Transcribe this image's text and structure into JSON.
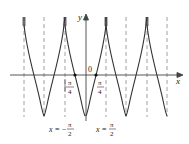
{
  "diagram": {
    "type": "function-graph",
    "axes": {
      "x_label": "x",
      "y_label": "y",
      "origin_label": "0"
    },
    "tick_labels": [
      {
        "id": "neg_pi_4",
        "numerator": "π",
        "denominator": "4",
        "sign": "",
        "prefix_bar": true
      },
      {
        "id": "pos_pi_4",
        "numerator": "π",
        "denominator": "4",
        "sign": ""
      }
    ],
    "asymptote_labels": [
      {
        "id": "neg_pi_2",
        "lhs": "x",
        "eq": "=",
        "sign": "−",
        "numerator": "π",
        "denominator": "2"
      },
      {
        "id": "pos_pi_2",
        "lhs": "x",
        "eq": "=",
        "numerator": "π",
        "denominator": "2"
      }
    ],
    "colors": {
      "curve": "#333333",
      "axis": "#444444",
      "asymptote": "#777777"
    }
  }
}
